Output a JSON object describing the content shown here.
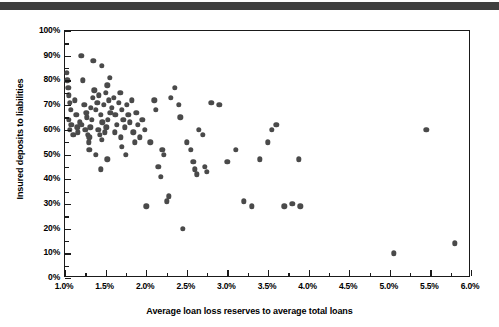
{
  "header": {
    "present": true,
    "color": "#3f3f3f"
  },
  "chart_data": {
    "type": "scatter",
    "title": "",
    "xlabel": "Average loan loss reserves to average total loans",
    "ylabel": "Insured deposits to liabilities",
    "xlim": [
      1.0,
      6.0
    ],
    "ylim": [
      0,
      100
    ],
    "xtick_labels": [
      "1.0%",
      "1.5%",
      "2.0%",
      "2.5%",
      "3.0%",
      "3.5%",
      "4.0%",
      "4.5%",
      "5.0%",
      "5.5%",
      "6.0%"
    ],
    "xtick_values": [
      1.0,
      1.5,
      2.0,
      2.5,
      3.0,
      3.5,
      4.0,
      4.5,
      5.0,
      5.5,
      6.0
    ],
    "xminor_values": [
      1.25,
      1.75,
      2.25,
      2.75,
      3.25,
      3.75,
      4.25,
      4.75,
      5.25,
      5.75
    ],
    "ytick_labels": [
      "0%",
      "10%",
      "20%",
      "30%",
      "40%",
      "50%",
      "60%",
      "70%",
      "80%",
      "90%",
      "100%"
    ],
    "ytick_values": [
      0,
      10,
      20,
      30,
      40,
      50,
      60,
      70,
      80,
      90,
      100
    ],
    "yminor_values": [
      5,
      15,
      25,
      35,
      45,
      55,
      65,
      75,
      85,
      95
    ],
    "grid": false,
    "legend": null,
    "marker_color": "#4a4a4a",
    "marker_size_px": 5.4,
    "points": [
      [
        1.02,
        83
      ],
      [
        1.03,
        80
      ],
      [
        1.04,
        77
      ],
      [
        1.05,
        74
      ],
      [
        1.06,
        71
      ],
      [
        1.07,
        68
      ],
      [
        1.05,
        64
      ],
      [
        1.08,
        62
      ],
      [
        1.06,
        60
      ],
      [
        1.1,
        58
      ],
      [
        1.12,
        72
      ],
      [
        1.14,
        66
      ],
      [
        1.15,
        61
      ],
      [
        1.16,
        59
      ],
      [
        1.18,
        63
      ],
      [
        1.2,
        90
      ],
      [
        1.22,
        80
      ],
      [
        1.24,
        70
      ],
      [
        1.26,
        67
      ],
      [
        1.21,
        62
      ],
      [
        1.25,
        60
      ],
      [
        1.28,
        58
      ],
      [
        1.3,
        57
      ],
      [
        1.27,
        65
      ],
      [
        1.32,
        69
      ],
      [
        1.34,
        73
      ],
      [
        1.36,
        76
      ],
      [
        1.33,
        64
      ],
      [
        1.31,
        61
      ],
      [
        1.29,
        55
      ],
      [
        1.38,
        68
      ],
      [
        1.4,
        71
      ],
      [
        1.42,
        74
      ],
      [
        1.44,
        66
      ],
      [
        1.46,
        63
      ],
      [
        1.41,
        60
      ],
      [
        1.43,
        58
      ],
      [
        1.45,
        56
      ],
      [
        1.48,
        70
      ],
      [
        1.5,
        75
      ],
      [
        1.52,
        78
      ],
      [
        1.54,
        72
      ],
      [
        1.56,
        67
      ],
      [
        1.53,
        64
      ],
      [
        1.51,
        61
      ],
      [
        1.49,
        59
      ],
      [
        1.58,
        69
      ],
      [
        1.6,
        73
      ],
      [
        1.62,
        66
      ],
      [
        1.64,
        62
      ],
      [
        1.61,
        59
      ],
      [
        1.66,
        71
      ],
      [
        1.68,
        75
      ],
      [
        1.7,
        68
      ],
      [
        1.72,
        64
      ],
      [
        1.74,
        61
      ],
      [
        1.69,
        57
      ],
      [
        1.76,
        70
      ],
      [
        1.78,
        66
      ],
      [
        1.8,
        63
      ],
      [
        1.82,
        72
      ],
      [
        1.84,
        59
      ],
      [
        1.86,
        55
      ],
      [
        1.88,
        67
      ],
      [
        1.9,
        62
      ],
      [
        1.35,
        88
      ],
      [
        1.45,
        86
      ],
      [
        1.55,
        81
      ],
      [
        1.3,
        52
      ],
      [
        1.38,
        50
      ],
      [
        1.52,
        48
      ],
      [
        1.44,
        44
      ],
      [
        1.7,
        53
      ],
      [
        1.75,
        50
      ],
      [
        1.92,
        57
      ],
      [
        1.95,
        64
      ],
      [
        1.98,
        60
      ],
      [
        2.0,
        29
      ],
      [
        2.05,
        55
      ],
      [
        2.1,
        72
      ],
      [
        2.12,
        68
      ],
      [
        2.15,
        45
      ],
      [
        2.18,
        41
      ],
      [
        2.2,
        52
      ],
      [
        2.22,
        50
      ],
      [
        2.25,
        31
      ],
      [
        2.28,
        33
      ],
      [
        2.3,
        73
      ],
      [
        2.35,
        77
      ],
      [
        2.4,
        70
      ],
      [
        2.42,
        65
      ],
      [
        2.45,
        20
      ],
      [
        2.5,
        55
      ],
      [
        2.55,
        52
      ],
      [
        2.58,
        47
      ],
      [
        2.6,
        44
      ],
      [
        2.62,
        42
      ],
      [
        2.65,
        60
      ],
      [
        2.7,
        58
      ],
      [
        2.72,
        45
      ],
      [
        2.75,
        43
      ],
      [
        2.8,
        71
      ],
      [
        2.9,
        70
      ],
      [
        3.0,
        47
      ],
      [
        3.1,
        52
      ],
      [
        3.2,
        31
      ],
      [
        3.3,
        29
      ],
      [
        3.4,
        48
      ],
      [
        3.5,
        55
      ],
      [
        3.55,
        60
      ],
      [
        3.6,
        62
      ],
      [
        3.7,
        29
      ],
      [
        3.8,
        30
      ],
      [
        3.88,
        48
      ],
      [
        3.9,
        29
      ],
      [
        5.05,
        10
      ],
      [
        5.45,
        60
      ],
      [
        5.8,
        14
      ]
    ]
  }
}
